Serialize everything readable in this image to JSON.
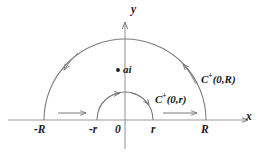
{
  "figure": {
    "axes": {
      "x_label": "x",
      "y_label": "y",
      "origin_label": "0"
    },
    "tick_labels": {
      "minus_R": "-R",
      "minus_r": "-r",
      "origin": "0",
      "r": "r",
      "R": "R"
    },
    "points": [
      {
        "name": "pole",
        "label": "ai",
        "marker": "dot"
      }
    ],
    "curves": [
      {
        "name": "outer-arc",
        "label_main": "C",
        "label_sup": "+",
        "label_args": "(0,R)",
        "label_full": "C+(0,R)",
        "direction": "counterclockwise"
      },
      {
        "name": "inner-arc",
        "label_main": "C",
        "label_sup": "+",
        "label_args": "(0,r)",
        "label_full": "C+(0,r)",
        "direction": "counterclockwise"
      }
    ],
    "segments": [
      {
        "name": "left-segment",
        "from": "-R",
        "to": "-r",
        "direction": "rightward"
      },
      {
        "name": "right-segment",
        "from": "r",
        "to": "R",
        "direction": "rightward"
      }
    ],
    "colors": {
      "stroke": "#6b6b6b",
      "axis": "#8a8a8a",
      "text": "#1a1a1a",
      "background": "#ffffff"
    }
  }
}
